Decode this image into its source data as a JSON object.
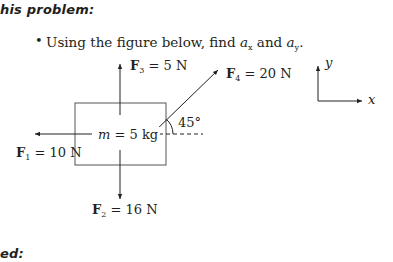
{
  "page": {
    "heading_top": "his problem:",
    "heading_bottom": "ed:",
    "bullet": {
      "symbol": "•",
      "prefix": "Using the figure below, find ",
      "var1": "a",
      "var1_sub": "x",
      "middle": " and ",
      "var2": "a",
      "var2_sub": "y",
      "suffix": "."
    }
  },
  "figure": {
    "mass_label": {
      "var": "m",
      "text": " = 5 kg"
    },
    "angle_label": "45°",
    "forces": [
      {
        "id": "F1",
        "symbol": "F",
        "sub": "1",
        "value": " = 10 N",
        "direction": "left"
      },
      {
        "id": "F2",
        "symbol": "F",
        "sub": "2",
        "value": " = 16 N",
        "direction": "down"
      },
      {
        "id": "F3",
        "symbol": "F",
        "sub": "3",
        "value": " = 5 N",
        "direction": "up"
      },
      {
        "id": "F4",
        "symbol": "F",
        "sub": "4",
        "value": " = 20 N",
        "direction": "45° up-right"
      }
    ],
    "axes": {
      "x_label": "x",
      "y_label": "y"
    }
  },
  "colors": {
    "ink": "#231f20",
    "box": "#555555"
  }
}
